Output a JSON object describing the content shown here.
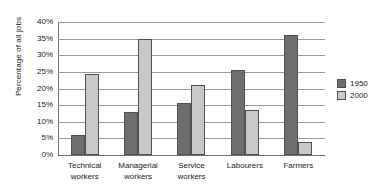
{
  "chart_data": {
    "type": "bar",
    "title": "",
    "subtitle": "",
    "xlabel": "",
    "ylabel": "Percentage of all jobs",
    "ylim": [
      0,
      40
    ],
    "ytick_step": 5,
    "ytick_labels": [
      "40%",
      "35%",
      "30%",
      "25%",
      "20%",
      "15%",
      "10%",
      "5%",
      "0%"
    ],
    "ytick_values": [
      40,
      35,
      30,
      25,
      20,
      15,
      10,
      5,
      0
    ],
    "grid": "horizontal",
    "legend_position": "right",
    "categories": [
      "Technical workers",
      "Managerial workers",
      "Service workers",
      "Labourers",
      "Farmers"
    ],
    "category_lines": [
      [
        "Technical",
        "workers"
      ],
      [
        "Managerial",
        "workers"
      ],
      [
        "Service",
        "workers"
      ],
      [
        "Labourers",
        ""
      ],
      [
        "Farmers",
        ""
      ]
    ],
    "series": [
      {
        "name": "1950",
        "color": "#6e6e6e",
        "values": [
          6,
          13,
          15.5,
          25.5,
          36
        ]
      },
      {
        "name": "2000",
        "color": "#c9c9c9",
        "values": [
          24.5,
          35,
          21,
          13.5,
          4
        ]
      }
    ]
  },
  "legend": {
    "entries": [
      {
        "label": "1950",
        "color": "#6e6e6e"
      },
      {
        "label": "2000",
        "color": "#c9c9c9"
      }
    ]
  },
  "axes": {
    "y_title": "Percentage of all jobs"
  }
}
